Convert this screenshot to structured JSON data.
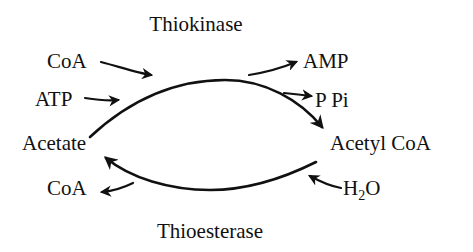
{
  "diagram": {
    "enzymes": {
      "top": "Thiokinase",
      "bottom": "Thioesterase"
    },
    "nodes": {
      "left": "Acetate",
      "right": "Acetyl CoA"
    },
    "top_reaction": {
      "inputs": [
        "CoA",
        "ATP"
      ],
      "outputs": [
        "AMP",
        "P Pi"
      ]
    },
    "bottom_reaction": {
      "input_main": "H",
      "input_sub": "2",
      "input_tail": "O",
      "output": "CoA"
    },
    "colors": {
      "ink": "#111111",
      "background": "#ffffff"
    }
  }
}
